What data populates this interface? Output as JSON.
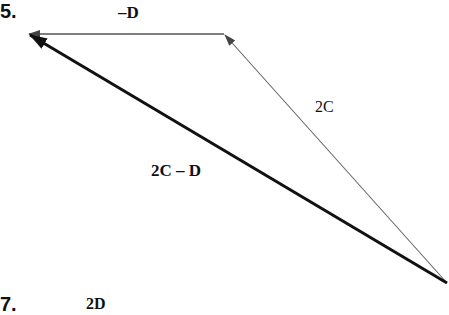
{
  "problem_numbers": {
    "current": "5.",
    "next": "7."
  },
  "vectors": [
    {
      "label": "–D",
      "from": [
        224,
        34
      ],
      "to": [
        28,
        34
      ],
      "weight": "thin"
    },
    {
      "label": "2C",
      "from": [
        447,
        283
      ],
      "to": [
        224,
        34
      ],
      "weight": "thin"
    },
    {
      "label": "2C – D",
      "from": [
        447,
        283
      ],
      "to": [
        28,
        34
      ],
      "weight": "thick"
    }
  ],
  "labels": {
    "neg_d": "–D",
    "two_c": "2C",
    "result": "2C – D",
    "next_partial": "2D"
  },
  "colors": {
    "thin": "#555555",
    "thick": "#111111"
  }
}
